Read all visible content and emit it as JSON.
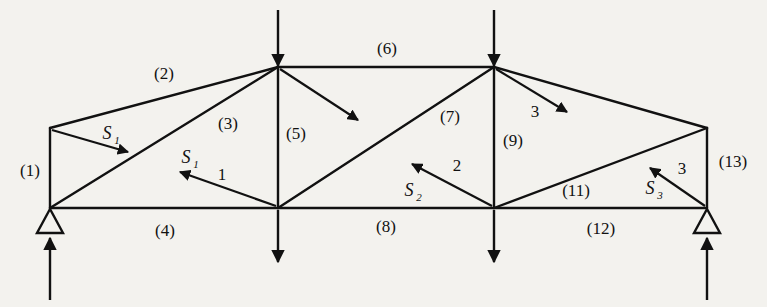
{
  "figure": {
    "type": "truss-free-body-diagram",
    "background_color": "#f3f2ee",
    "line_color": "#111111",
    "member_labels": [
      {
        "id": "m1",
        "text": "(1)",
        "x": 30,
        "y": 176
      },
      {
        "id": "m2",
        "text": "(2)",
        "x": 164,
        "y": 79
      },
      {
        "id": "m3",
        "text": "(3)",
        "x": 228,
        "y": 129
      },
      {
        "id": "m4",
        "text": "(4)",
        "x": 165,
        "y": 236
      },
      {
        "id": "m5",
        "text": "(5)",
        "x": 291,
        "y": 139
      },
      {
        "id": "m6",
        "text": "(6)",
        "x": 387,
        "y": 54
      },
      {
        "id": "m7",
        "text": "(7)",
        "x": 444,
        "y": 122
      },
      {
        "id": "m8",
        "text": "(8)",
        "x": 386,
        "y": 232
      },
      {
        "id": "m9",
        "text": "(9)",
        "x": 505,
        "y": 146
      },
      {
        "id": "m11",
        "text": "(11)",
        "x": 568,
        "y": 196
      },
      {
        "id": "m12",
        "text": "(12)",
        "x": 592,
        "y": 234
      },
      {
        "id": "m13",
        "text": "(13)",
        "x": 717,
        "y": 167
      }
    ],
    "force_labels": [
      {
        "id": "s1-upper",
        "base": "S",
        "sub": "1",
        "x": 107,
        "y": 139
      },
      {
        "id": "s1-lower",
        "base": "S",
        "sub": "1",
        "x": 181,
        "y": 163
      },
      {
        "id": "s2",
        "base": "S",
        "sub": "2",
        "x": 404,
        "y": 196
      },
      {
        "id": "s3",
        "base": "S",
        "sub": "3",
        "x": 645,
        "y": 194
      }
    ],
    "section_labels": [
      {
        "id": "cut-1",
        "text": "1",
        "x": 222,
        "y": 180
      },
      {
        "id": "cut-2",
        "text": "2",
        "x": 457,
        "y": 171
      },
      {
        "id": "cut-3-upper",
        "text": "3",
        "x": 535,
        "y": 117
      },
      {
        "id": "cut-3-lower",
        "text": "3",
        "x": 682,
        "y": 174
      }
    ],
    "nodes": [
      {
        "id": "left-eave",
        "x": 50,
        "y": 128
      },
      {
        "id": "left-support",
        "x": 50,
        "y": 208
      },
      {
        "id": "apex-left",
        "x": 278,
        "y": 67
      },
      {
        "id": "mid-bottom",
        "x": 278,
        "y": 208
      },
      {
        "id": "apex-right",
        "x": 494,
        "y": 67
      },
      {
        "id": "right-bottom",
        "x": 494,
        "y": 208
      },
      {
        "id": "right-eave",
        "x": 707,
        "y": 128
      },
      {
        "id": "right-support",
        "x": 707,
        "y": 208
      }
    ]
  }
}
